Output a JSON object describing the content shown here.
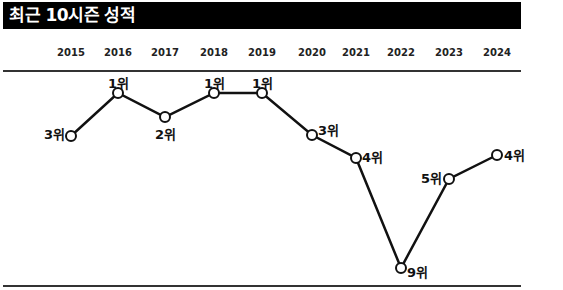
{
  "title": "최근 10시즌 성적",
  "chart_data": {
    "type": "line",
    "title": "최근 10시즌 성적",
    "categories": [
      "2015",
      "2016",
      "2017",
      "2018",
      "2019",
      "2020",
      "2021",
      "2022",
      "2023",
      "2024"
    ],
    "values": [
      3,
      1,
      2,
      1,
      1,
      3,
      4,
      9,
      5,
      4
    ],
    "labels": [
      "3위",
      "1위",
      "2위",
      "1위",
      "1위",
      "3위",
      "4위",
      "9위",
      "5위",
      "4위"
    ],
    "xlabel": "",
    "ylabel": "순위",
    "y_inverted": true,
    "grid": false,
    "legend": null
  },
  "points": [
    {
      "x": 71,
      "y": 136,
      "lx": 44,
      "ly": 124
    },
    {
      "x": 118,
      "y": 93,
      "lx": 108,
      "ly": 73
    },
    {
      "x": 165,
      "y": 117,
      "lx": 155,
      "ly": 124
    },
    {
      "x": 214,
      "y": 93,
      "lx": 204,
      "ly": 73
    },
    {
      "x": 262,
      "y": 93,
      "lx": 252,
      "ly": 73
    },
    {
      "x": 312,
      "y": 135,
      "lx": 318,
      "ly": 120
    },
    {
      "x": 356,
      "y": 158,
      "lx": 362,
      "ly": 147
    },
    {
      "x": 401,
      "y": 268,
      "lx": 407,
      "ly": 262
    },
    {
      "x": 449,
      "y": 179,
      "lx": 421,
      "ly": 168
    },
    {
      "x": 497,
      "y": 155,
      "lx": 504,
      "ly": 145
    }
  ],
  "colors": {
    "line": "#111111",
    "title_bg": "#000000",
    "title_fg": "#ffffff"
  }
}
